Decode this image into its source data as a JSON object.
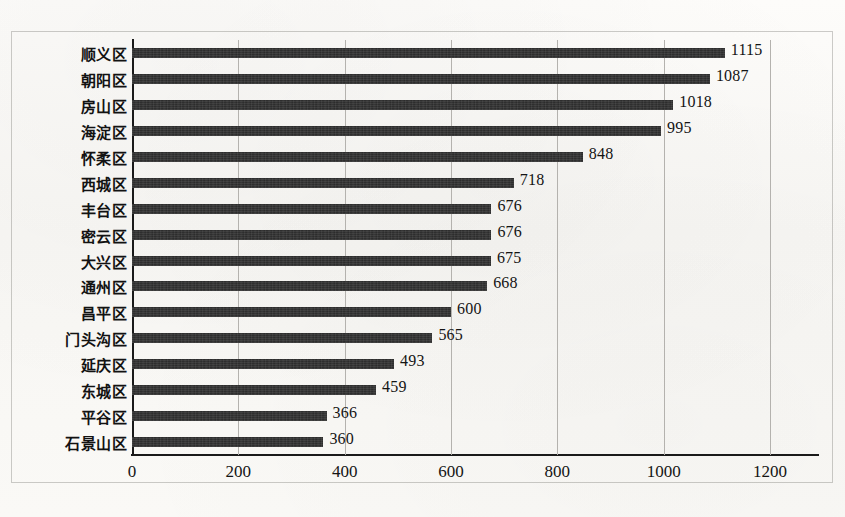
{
  "chart_data": {
    "type": "bar",
    "orientation": "horizontal",
    "title": "",
    "subtitle": "",
    "xlabel": "",
    "ylabel": "",
    "xlim": [
      0,
      1200
    ],
    "xticks": [
      "0",
      "200",
      "400",
      "600",
      "800",
      "1000",
      "1200"
    ],
    "xtick_values": [
      0,
      200,
      400,
      600,
      800,
      1000,
      1200
    ],
    "grid": true,
    "grid_axis": "x",
    "legend": false,
    "legend_position": "none",
    "bar_color": "#232323",
    "gridline_color": "#b4b2ae",
    "axis_color": "#1a1a1a",
    "background_color": "#faf9f6",
    "data_labels": true,
    "categories": [
      "顺义区",
      "朝阳区",
      "房山区",
      "海淀区",
      "怀柔区",
      "西城区",
      "丰台区",
      "密云区",
      "大兴区",
      "通州区",
      "昌平区",
      "门头沟区",
      "延庆区",
      "东城区",
      "平谷区",
      "石景山区"
    ],
    "values": [
      1115,
      1087,
      1018,
      995,
      848,
      718,
      676,
      676,
      675,
      668,
      600,
      565,
      493,
      459,
      366,
      360
    ],
    "value_labels": [
      "1115",
      "1087",
      "1018",
      "995",
      "848",
      "718",
      "676",
      "676",
      "675",
      "668",
      "600",
      "565",
      "493",
      "459",
      "366",
      "360"
    ]
  }
}
